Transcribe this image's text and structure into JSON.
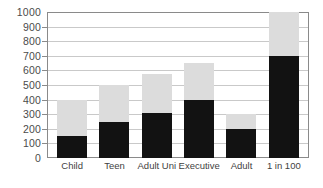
{
  "chart_data": {
    "type": "bar",
    "stacked": true,
    "title": "",
    "subtitle": "",
    "xlabel": "",
    "ylabel": "",
    "ylim": [
      0,
      1000
    ],
    "ytick_step": 100,
    "yticks": [
      1000,
      900,
      800,
      700,
      600,
      500,
      400,
      300,
      200,
      100,
      0
    ],
    "ytick_labels": [
      "1000",
      "900",
      "800",
      "700",
      "600",
      "500",
      "400",
      "300",
      "200",
      "100",
      "0"
    ],
    "grid": true,
    "grid_axis": "y",
    "legend": "none",
    "categories": [
      "Child",
      "Teen",
      "Adult Uni",
      "Executive",
      "Adult",
      "1 in 100"
    ],
    "series": [
      {
        "name": "lower",
        "color": "#121212",
        "values": [
          150,
          250,
          310,
          400,
          200,
          700
        ]
      },
      {
        "name": "upper",
        "color": "#dcdcdc",
        "values": [
          250,
          250,
          265,
          250,
          100,
          300
        ]
      }
    ],
    "totals": [
      400,
      500,
      575,
      650,
      300,
      1000
    ]
  },
  "colors": {
    "bar_dark": "#121212",
    "bar_light": "#dcdcdc",
    "gridline": "#c9c9c9",
    "frame": "#8a8a8a",
    "axis": "#9a9a9a",
    "tick_text": "#4b4b4b",
    "category_text": "#3f3f3f",
    "background": "#ffffff"
  }
}
